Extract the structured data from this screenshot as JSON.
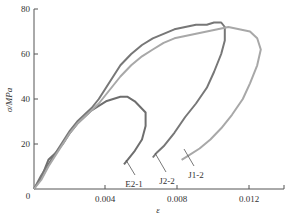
{
  "chart_data": {
    "type": "line",
    "title": "",
    "xlabel": "ε",
    "ylabel": "σ/MPa",
    "xlim": [
      0,
      0.0144
    ],
    "ylim": [
      0,
      80
    ],
    "x_ticks": [
      0.004,
      0.008,
      0.012
    ],
    "x_tick_labels": [
      "0.004",
      "0.008",
      "0.012"
    ],
    "y_ticks": [
      0,
      20,
      40,
      60,
      80
    ],
    "y_tick_labels": [
      "0",
      "20",
      "40",
      "60",
      "80"
    ],
    "origin_label": "0",
    "grid": false,
    "legend": "inline labels with leader lines",
    "series": [
      {
        "name": "E2-1",
        "color": "#6e6e6e",
        "points": [
          [
            0.0,
            0
          ],
          [
            0.0004,
            5
          ],
          [
            0.0008,
            13
          ],
          [
            0.0012,
            16
          ],
          [
            0.0016,
            20
          ],
          [
            0.002,
            25
          ],
          [
            0.0024,
            29
          ],
          [
            0.0028,
            32
          ],
          [
            0.0032,
            35
          ],
          [
            0.0036,
            37
          ],
          [
            0.004,
            39
          ],
          [
            0.0044,
            40
          ],
          [
            0.0048,
            41
          ],
          [
            0.0052,
            41
          ],
          [
            0.0056,
            39
          ],
          [
            0.0062,
            34
          ],
          [
            0.0062,
            28
          ],
          [
            0.006,
            22
          ],
          [
            0.0056,
            17
          ],
          [
            0.0052,
            13
          ],
          [
            0.005,
            11
          ]
        ]
      },
      {
        "name": "J2-2",
        "color": "#777777",
        "points": [
          [
            0.0,
            0
          ],
          [
            0.0004,
            6
          ],
          [
            0.0008,
            11
          ],
          [
            0.0012,
            16
          ],
          [
            0.0016,
            21
          ],
          [
            0.002,
            26
          ],
          [
            0.0024,
            30
          ],
          [
            0.0028,
            33
          ],
          [
            0.0032,
            36
          ],
          [
            0.0036,
            40
          ],
          [
            0.004,
            45
          ],
          [
            0.0044,
            50
          ],
          [
            0.0048,
            55
          ],
          [
            0.0054,
            60
          ],
          [
            0.006,
            64
          ],
          [
            0.0066,
            67
          ],
          [
            0.0072,
            69
          ],
          [
            0.0078,
            71
          ],
          [
            0.0084,
            72
          ],
          [
            0.009,
            73
          ],
          [
            0.0096,
            73
          ],
          [
            0.01,
            74
          ],
          [
            0.0104,
            74
          ],
          [
            0.0106,
            72
          ],
          [
            0.0106,
            66
          ],
          [
            0.0104,
            60
          ],
          [
            0.01,
            52
          ],
          [
            0.0096,
            45
          ],
          [
            0.009,
            38
          ],
          [
            0.0084,
            32
          ],
          [
            0.0078,
            25
          ],
          [
            0.0072,
            19
          ],
          [
            0.0068,
            16
          ],
          [
            0.0066,
            14
          ]
        ]
      },
      {
        "name": "J1-2",
        "color": "#a8a8a8",
        "points": [
          [
            0.0,
            0
          ],
          [
            0.0004,
            4
          ],
          [
            0.0008,
            10
          ],
          [
            0.0012,
            15
          ],
          [
            0.0016,
            20
          ],
          [
            0.002,
            25
          ],
          [
            0.0024,
            29
          ],
          [
            0.0028,
            32
          ],
          [
            0.0032,
            35
          ],
          [
            0.0036,
            38
          ],
          [
            0.004,
            42
          ],
          [
            0.0044,
            46
          ],
          [
            0.0048,
            50
          ],
          [
            0.0054,
            55
          ],
          [
            0.006,
            59
          ],
          [
            0.0066,
            62
          ],
          [
            0.0072,
            65
          ],
          [
            0.0078,
            67
          ],
          [
            0.0084,
            68
          ],
          [
            0.009,
            69
          ],
          [
            0.0096,
            70
          ],
          [
            0.0102,
            71
          ],
          [
            0.0108,
            72
          ],
          [
            0.0114,
            71
          ],
          [
            0.012,
            70
          ],
          [
            0.0124,
            67
          ],
          [
            0.0126,
            62
          ],
          [
            0.0124,
            55
          ],
          [
            0.012,
            47
          ],
          [
            0.0116,
            40
          ],
          [
            0.011,
            33
          ],
          [
            0.0104,
            27
          ],
          [
            0.0098,
            22
          ],
          [
            0.0092,
            18
          ],
          [
            0.0086,
            15
          ],
          [
            0.0082,
            13
          ]
        ]
      }
    ],
    "annotations": [
      {
        "text": "E2-1",
        "points_to": [
          0.0051,
          12
        ]
      },
      {
        "text": "J2-2",
        "points_to": [
          0.0067,
          15
        ]
      },
      {
        "text": "J1-2",
        "points_to": [
          0.0083,
          14
        ]
      }
    ]
  }
}
